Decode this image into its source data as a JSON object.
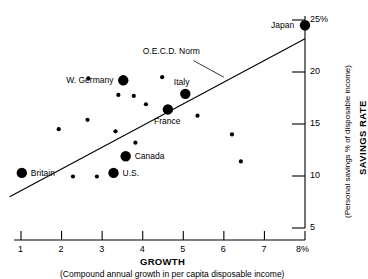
{
  "chart_data": {
    "type": "scatter",
    "title": "",
    "xlabel": "GROWTH",
    "xlabel_sub": "(Compound annual growth in per capita disposable income)",
    "ylabel": "SAVINGS RATE",
    "ylabel_sub": "(Personal savings % of disposable income)",
    "xlim": [
      0.6,
      8.3
    ],
    "ylim": [
      4.2,
      25.6
    ],
    "x_ticks": [
      "1",
      "2",
      "3",
      "4",
      "5",
      "6",
      "7",
      "8%"
    ],
    "x_tick_values": [
      1,
      2,
      3,
      4,
      5,
      6,
      7,
      8
    ],
    "y_ticks": [
      "25%",
      "20",
      "15",
      "10",
      "5"
    ],
    "y_tick_values": [
      25,
      20,
      15,
      10,
      5
    ],
    "grid": false,
    "legend": "none",
    "axis_position": {
      "y_axis": "right",
      "x_axis": "bottom"
    },
    "marker_color": "#000000",
    "line_color": "#000000",
    "trendline": {
      "label": "O.E.C.D. Norm",
      "x1": 0.72,
      "y1": 8.0,
      "x2": 8.0,
      "y2": 23.2,
      "callout_from_x": 5.25,
      "callout_from_y": 21.1,
      "callout_to_x": 6.0,
      "callout_to_y": 19.5
    },
    "labeled_points": [
      {
        "name": "Japan",
        "x": 8.0,
        "y": 24.5,
        "size": "large",
        "label_pos": "left"
      },
      {
        "name": "Italy",
        "x": 5.05,
        "y": 17.9,
        "size": "large",
        "label_pos": "above"
      },
      {
        "name": "W. Germany",
        "x": 3.52,
        "y": 19.2,
        "size": "large",
        "label_pos": "left"
      },
      {
        "name": "France",
        "x": 4.62,
        "y": 16.4,
        "size": "large",
        "label_pos": "below"
      },
      {
        "name": "Canada",
        "x": 3.58,
        "y": 11.9,
        "size": "large",
        "label_pos": "right"
      },
      {
        "name": "U.S.",
        "x": 3.28,
        "y": 10.3,
        "size": "large",
        "label_pos": "right"
      },
      {
        "name": "Britain",
        "x": 1.02,
        "y": 10.3,
        "size": "large",
        "label_pos": "right"
      }
    ],
    "unlabeled_points": [
      {
        "x": 2.66,
        "y": 19.4,
        "size": "small"
      },
      {
        "x": 4.48,
        "y": 19.5,
        "size": "small"
      },
      {
        "x": 3.4,
        "y": 17.8,
        "size": "small"
      },
      {
        "x": 3.78,
        "y": 17.7,
        "size": "small"
      },
      {
        "x": 4.08,
        "y": 16.9,
        "size": "small"
      },
      {
        "x": 2.64,
        "y": 15.4,
        "size": "small"
      },
      {
        "x": 5.35,
        "y": 15.8,
        "size": "small"
      },
      {
        "x": 1.93,
        "y": 14.5,
        "size": "small"
      },
      {
        "x": 3.33,
        "y": 14.3,
        "size": "small"
      },
      {
        "x": 3.82,
        "y": 13.2,
        "size": "small"
      },
      {
        "x": 6.2,
        "y": 14.0,
        "size": "small"
      },
      {
        "x": 6.42,
        "y": 11.4,
        "size": "small"
      },
      {
        "x": 2.28,
        "y": 9.95,
        "size": "small"
      },
      {
        "x": 2.87,
        "y": 9.95,
        "size": "small"
      }
    ]
  }
}
